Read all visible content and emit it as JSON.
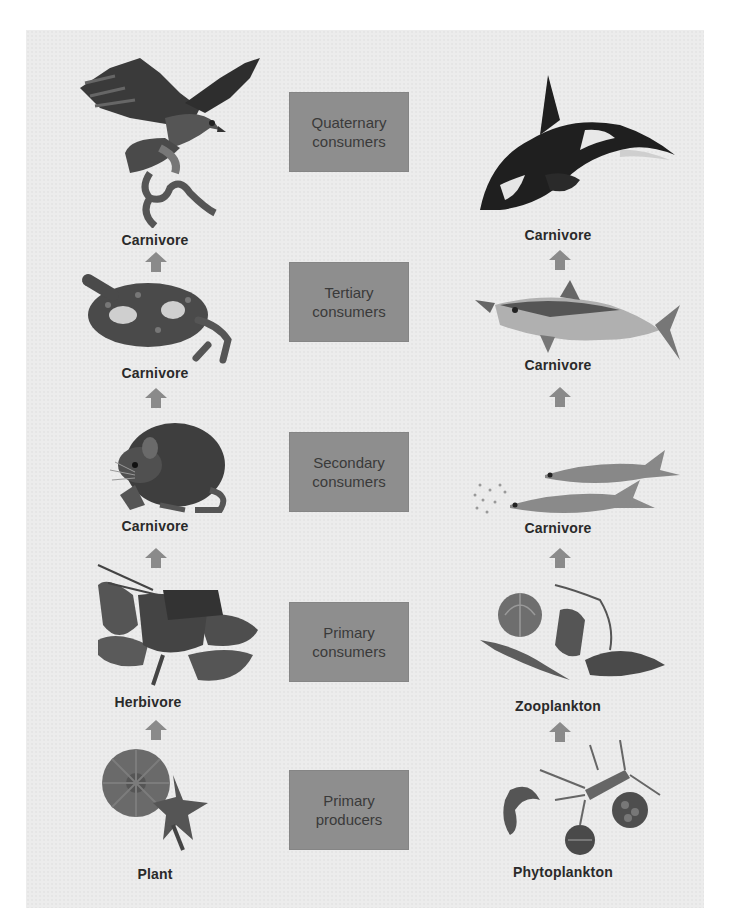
{
  "diagram": {
    "type": "food-chain-comparison",
    "columns": [
      "terrestrial",
      "marine"
    ],
    "levels": [
      {
        "name": "Quaternary consumers",
        "terrestrial": {
          "label": "Carnivore",
          "organism": "hawk"
        },
        "marine": {
          "label": "Carnivore",
          "organism": "killer-whale"
        }
      },
      {
        "name": "Tertiary consumers",
        "terrestrial": {
          "label": "Carnivore",
          "organism": "snake"
        },
        "marine": {
          "label": "Carnivore",
          "organism": "tuna"
        }
      },
      {
        "name": "Secondary consumers",
        "terrestrial": {
          "label": "Carnivore",
          "organism": "mouse"
        },
        "marine": {
          "label": "Carnivore",
          "organism": "herring"
        }
      },
      {
        "name": "Primary consumers",
        "terrestrial": {
          "label": "Herbivore",
          "organism": "grasshopper"
        },
        "marine": {
          "label": "Zooplankton",
          "organism": "zooplankton"
        }
      },
      {
        "name": "Primary producers",
        "terrestrial": {
          "label": "Plant",
          "organism": "plant"
        },
        "marine": {
          "label": "Phytoplankton",
          "organism": "phytoplankton"
        }
      }
    ]
  },
  "boxes": {
    "quaternary": "Quaternary\nconsumers",
    "tertiary": "Tertiary\nconsumers",
    "secondary": "Secondary\nconsumers",
    "primary_consumers": "Primary\nconsumers",
    "primary_producers": "Primary\nproducers"
  },
  "labels": {
    "left": [
      "Carnivore",
      "Carnivore",
      "Carnivore",
      "Herbivore",
      "Plant"
    ],
    "right": [
      "Carnivore",
      "Carnivore",
      "Carnivore",
      "Zooplankton",
      "Phytoplankton"
    ]
  },
  "colors": {
    "panel": "#ececec",
    "box": "#8e8e8e",
    "arrow": "#8a8a8a",
    "text": "#2a2a2a"
  }
}
